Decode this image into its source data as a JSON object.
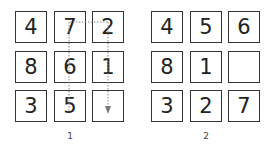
{
  "puzzles": [
    {
      "label": "1",
      "cells": [
        "4",
        "7",
        "2",
        "8",
        "6",
        "1",
        "3",
        "5",
        ""
      ],
      "annotation": "dotted move path from 7 to 2 and down to empty cell; dotted line from 7 down to 5"
    },
    {
      "label": "2",
      "cells": [
        "4",
        "5",
        "6",
        "8",
        "1",
        "",
        "3",
        "2",
        "7"
      ]
    }
  ],
  "colors": {
    "border": "#333333",
    "text": "#222222",
    "path": "#888888"
  }
}
